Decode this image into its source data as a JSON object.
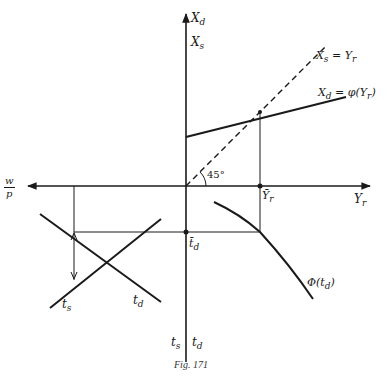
{
  "figure": {
    "caption": "Fig. 171",
    "colors": {
      "ink": "#1a1a1a",
      "background": "#ffffff"
    }
  },
  "axes": {
    "vertical_top": {
      "label_upper_main": "X",
      "label_upper_sub": "d",
      "label_lower_main": "X",
      "label_lower_sub": "s"
    },
    "vertical_bottom": {
      "left_main": "t",
      "left_sub": "s",
      "right_main": "t",
      "right_sub": "d"
    },
    "horizontal_right": {
      "main": "Y",
      "sub": "r"
    },
    "horizontal_left": {
      "numerator": "w",
      "denominator": "p"
    }
  },
  "curves": {
    "line_45": {
      "label": "X",
      "label_sub": "s",
      "label_rest": " = Y",
      "label_rest_sub": "r"
    },
    "xd_function": {
      "label": "X",
      "label_sub": "d",
      "label_rest": " = φ(Y",
      "label_rest_sub": "r",
      "label_close": ")"
    },
    "phi_td": {
      "label": "Φ(t",
      "label_sub": "d",
      "label_close": ")"
    },
    "ts_curve": {
      "label": "t",
      "label_sub": "s"
    },
    "td_curve": {
      "label": "t",
      "label_sub": "d"
    }
  },
  "annotations": {
    "angle": "45°",
    "yr_bar": {
      "main": "Ȳ",
      "sub": "r"
    },
    "td_bar": {
      "main": "t̄",
      "sub": "d"
    }
  }
}
